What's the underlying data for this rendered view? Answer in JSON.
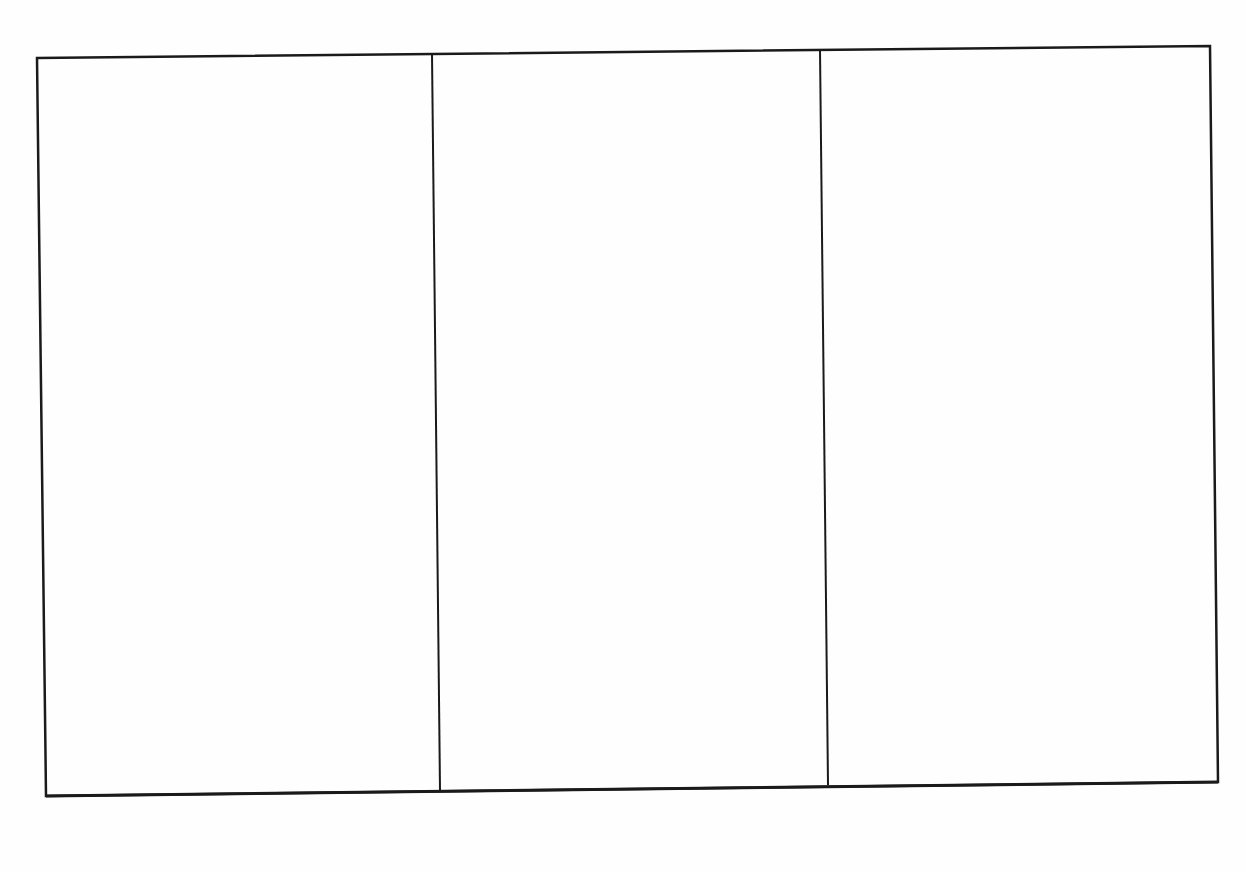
{
  "document": {
    "layout": "three-panel blank template",
    "panel_count": 3,
    "panels": [
      {
        "index": 1,
        "content": ""
      },
      {
        "index": 2,
        "content": ""
      },
      {
        "index": 3,
        "content": ""
      }
    ],
    "colors": {
      "background": "#fefefe",
      "stroke": "#1a1a1a"
    }
  }
}
